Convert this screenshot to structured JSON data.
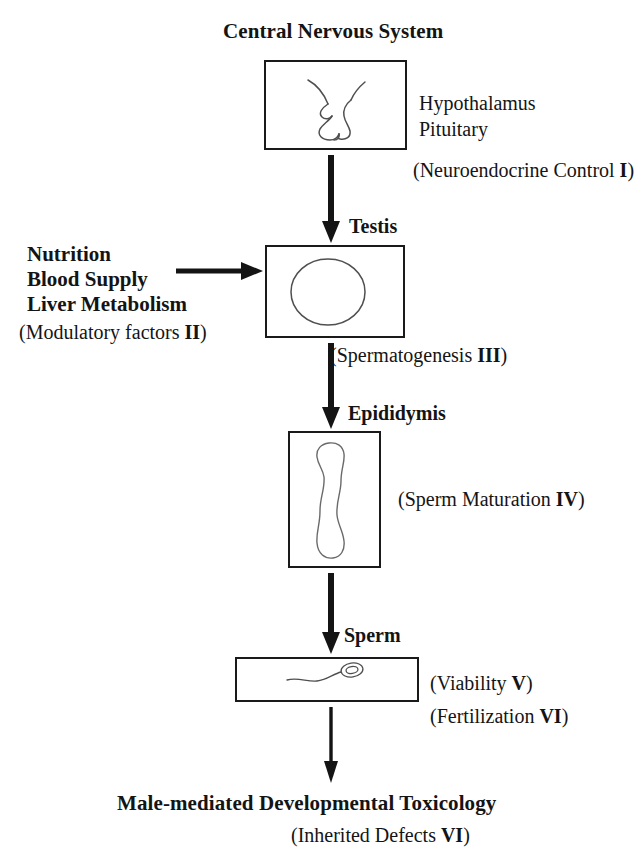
{
  "diagram": {
    "title": "Central Nervous System",
    "bottom_conclusion": "Male-mediated Developmental Toxicology",
    "stages": [
      {
        "heading": "Central Nervous System",
        "organ_labels": [
          "Hypothalamus",
          "Pituitary"
        ],
        "process_text": "(Neuroendocrine Control ",
        "process_numeral": "I",
        "process_close": ")",
        "icon": "brain-hypothalamus-pituitary-sketch"
      },
      {
        "heading": "Testis",
        "process_text": "(Spermatogenesis ",
        "process_numeral": "III",
        "process_close": ")",
        "icon": "testis-circle-sketch"
      },
      {
        "heading": "Epididymis",
        "process_text": "(Sperm Maturation ",
        "process_numeral": "IV",
        "process_close": ")",
        "icon": "epididymis-duct-sketch"
      },
      {
        "heading": "Sperm",
        "process_text": "(Viability ",
        "process_numeral": "V",
        "process_close": ")",
        "process_text2": "(Fertilization ",
        "process_numeral2": "VI",
        "process_close2": ")",
        "icon": "spermatozoon-sketch"
      }
    ],
    "modulatory": {
      "lines": [
        "Nutrition",
        "Blood Supply",
        "Liver Metabolism"
      ],
      "caption_text": "(Modulatory factors ",
      "caption_numeral": "II",
      "caption_close": ")"
    },
    "outcome": {
      "caption_text": "(Inherited Defects ",
      "caption_numeral": "VI",
      "caption_close": ")"
    },
    "colors": {
      "ink": "#141414",
      "stroke": "#1a1a1a",
      "sketch": "#4a4a4a",
      "background": "#ffffff"
    }
  }
}
